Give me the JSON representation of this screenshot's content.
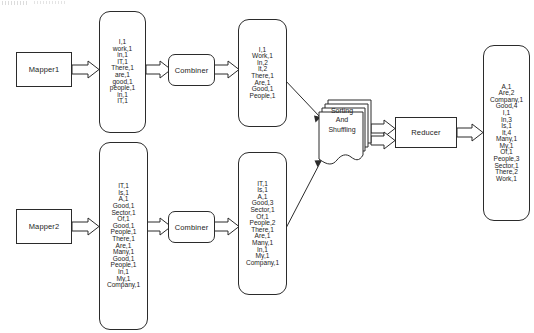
{
  "diagram": {
    "artifact_text": "",
    "stroke_color": "#2b2b2b",
    "background_color": "#ffffff"
  },
  "nodes": {
    "mapper1": "Mapper1",
    "mapper2": "Mapper2",
    "combiner1": "Combiner",
    "combiner2": "Combiner",
    "reducer": "Reducer",
    "shuffle_lines": [
      "Sorting",
      "And",
      "Shuffling"
    ]
  },
  "lists": {
    "mapper1_output": [
      "I,1",
      "work,1",
      "in,1",
      "IT,1",
      "There,1",
      "are,1",
      "good,1",
      "people,1",
      "in,1",
      "IT,1"
    ],
    "combiner1_output": [
      "I,1",
      "Work,1",
      "In,2",
      "It,2",
      "There,1",
      "Are,1",
      "Good,1",
      "People,1"
    ],
    "mapper2_output": [
      "IT,1",
      "Is,1",
      "A,1",
      "Good,1",
      "Sector,1",
      "Of,1",
      "Good,1",
      "People,1",
      "There,1",
      "Are,1",
      "Many,1",
      "Good,1",
      "People,1",
      "In,1",
      "My,1",
      "Company,1"
    ],
    "combiner2_output": [
      "IT,1",
      "Is,1",
      "A,1",
      "Good,3",
      "Sector,1",
      "Of,1",
      "People,2",
      "There,1",
      "Are,1",
      "Many,1",
      "In,1",
      "My,1",
      "Company,1"
    ],
    "reducer_output": [
      "A,1",
      "Are,2",
      "Company,1",
      "Good,4",
      "I,1",
      "In,3",
      "Is,1",
      "It,4",
      "Many,1",
      "My,1",
      "Of,1",
      "People,3",
      "Sector,1",
      "There,2",
      "Work,1"
    ]
  }
}
